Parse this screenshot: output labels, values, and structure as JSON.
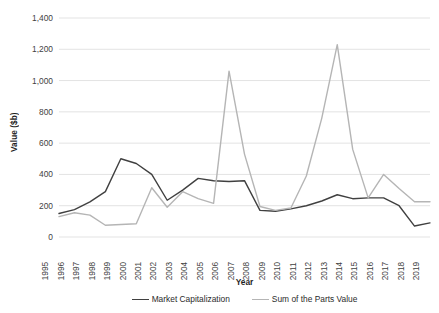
{
  "chart_data": {
    "type": "line",
    "title": "",
    "xlabel": "Year",
    "ylabel": "Value ($b)",
    "grid": true,
    "legend_position": "bottom",
    "xlim": [
      1995,
      2019
    ],
    "ylim": [
      0,
      1400
    ],
    "ytick_step": 200,
    "categories": [
      "1995",
      "1996",
      "1997",
      "1998",
      "1999",
      "2000",
      "2001",
      "2002",
      "2003",
      "2004",
      "2005",
      "2006",
      "2007",
      "2008",
      "2009",
      "2010",
      "2011",
      "2012",
      "2013",
      "2014",
      "2015",
      "2016",
      "2017",
      "2018",
      "2019"
    ],
    "ytick_labels": [
      "0",
      "200",
      "400",
      "600",
      "800",
      "1,000",
      "1,200",
      "1,400"
    ],
    "ytick_values": [
      0,
      200,
      400,
      600,
      800,
      1000,
      1200,
      1400
    ],
    "series": [
      {
        "name": "Market Capitalization",
        "color": "#404040",
        "values": [
          150,
          175,
          225,
          290,
          500,
          470,
          400,
          235,
          300,
          375,
          360,
          355,
          360,
          170,
          165,
          180,
          200,
          230,
          270,
          245,
          250,
          250,
          200,
          70,
          90
        ]
      },
      {
        "name": "Sum of the Parts Value",
        "color": "#b5b5b5",
        "values": [
          130,
          155,
          140,
          75,
          80,
          85,
          315,
          190,
          290,
          245,
          215,
          1060,
          530,
          195,
          170,
          185,
          390,
          760,
          1230,
          560,
          250,
          400,
          310,
          225,
          225
        ]
      }
    ]
  },
  "legend": {
    "entries": [
      {
        "label": "Market Capitalization",
        "color": "#404040"
      },
      {
        "label": "Sum of the Parts Value",
        "color": "#b5b5b5"
      }
    ]
  },
  "colors": {
    "background": "#ffffff",
    "gridline": "#e3e3e3",
    "axis_text": "#3f3f3f",
    "title_text": "#1f1f1f"
  }
}
